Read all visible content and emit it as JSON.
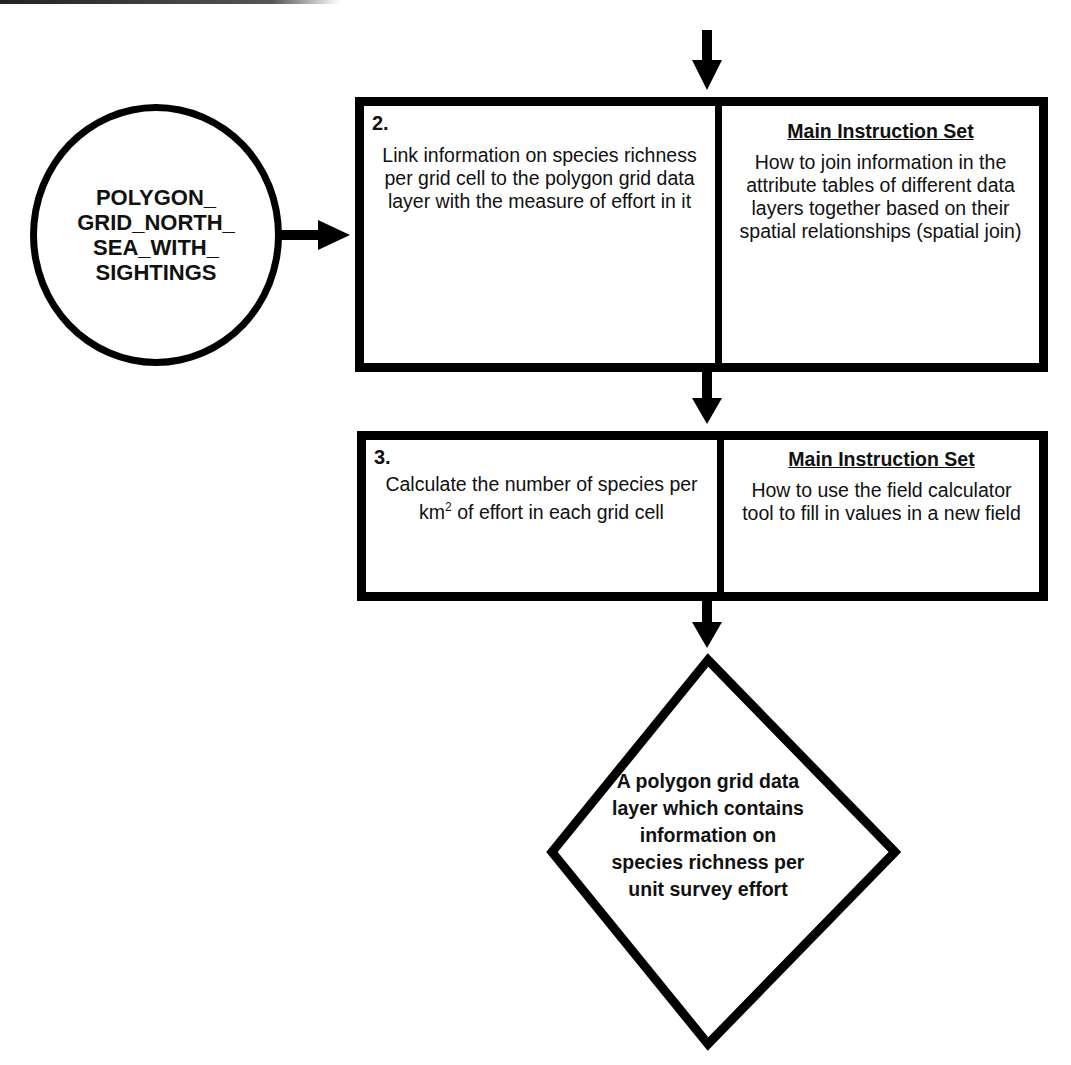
{
  "source_node": {
    "label": "POLYGON_\nGRID_NORTH_\nSEA_WITH_\nSIGHTINGS"
  },
  "steps": [
    {
      "number": "2.",
      "description": "Link information on species richness per grid cell to the polygon grid data layer with the measure of effort in it",
      "instruction_header": "Main Instruction Set",
      "instruction_text": "How to join information in the attribute tables of different data layers together based on their spatial relationships (spatial join)"
    },
    {
      "number": "3.",
      "description_pre": "Calculate the number of species per km",
      "description_sup": "2",
      "description_post": " of effort in each grid cell",
      "instruction_header": "Main Instruction Set",
      "instruction_text": "How to use the field calculator tool to fill in values in a new field"
    }
  ],
  "output_node": {
    "label": "A polygon grid data layer which contains information on species richness per unit survey effort"
  },
  "colors": {
    "stroke": "#000000",
    "background": "#ffffff"
  }
}
